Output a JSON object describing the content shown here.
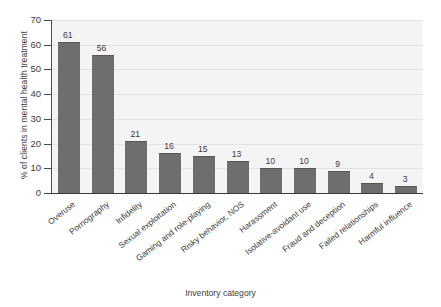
{
  "chart_data": {
    "type": "bar",
    "title": "",
    "xlabel": "Inventory category",
    "ylabel": "% of clients in mental health treatment",
    "ylim": [
      0,
      70
    ],
    "yticks": [
      0,
      10,
      20,
      30,
      40,
      50,
      60,
      70
    ],
    "grid": true,
    "legend": null,
    "bar_color": "#6e6e6e",
    "plot_background": "#f4f4f4",
    "categories": [
      "Overuse",
      "Pornography",
      "Infidelity",
      "Sexual exploitation",
      "Gaming and role-playing",
      "Risky behavior, NOS",
      "Harassment",
      "Isolative-avoidant use",
      "Fraud and deception",
      "Failed relationships",
      "Harmful influence"
    ],
    "values": [
      61,
      56,
      21,
      16,
      15,
      13,
      10,
      10,
      9,
      4,
      3
    ],
    "value_labels": [
      "61",
      "56",
      "21",
      "16",
      "15",
      "13",
      "10",
      "10",
      "9",
      "4",
      "3"
    ],
    "ytick_labels": [
      "0",
      "10",
      "20",
      "30",
      "40",
      "50",
      "60",
      "70"
    ]
  }
}
